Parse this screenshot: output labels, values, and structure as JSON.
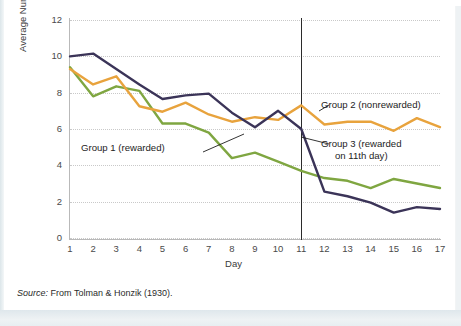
{
  "figure": {
    "source_prefix": "Source:",
    "source_text": "From Tolman & Honzik (1930)."
  },
  "annotations": {
    "group1": "Group 1 (rewarded)",
    "group2": "Group 2 (nonrewarded)",
    "group3_line1": "Group 3 (rewarded",
    "group3_line2": "on 11th day)"
  },
  "colors": {
    "group1_green": "#7FA641",
    "group2_orange": "#E8A33D",
    "group3_navy": "#3B3458",
    "axis": "#B9B9B9",
    "grid": "#C9C9C9",
    "marker_line": "#2B2B2B",
    "text": "#2B2B2B",
    "card_background": "#FFFFFF",
    "page_background": "#EEF2F4"
  },
  "chart_data": {
    "type": "line",
    "title": "",
    "xlabel": "Day",
    "ylabel": "Average Number of Errors",
    "x": [
      1,
      2,
      3,
      4,
      5,
      6,
      7,
      8,
      9,
      10,
      11,
      12,
      13,
      14,
      15,
      16,
      17
    ],
    "xtick_labels": [
      "1",
      "2",
      "3",
      "4",
      "5",
      "6",
      "7",
      "8",
      "9",
      "10",
      "11",
      "12",
      "13",
      "14",
      "15",
      "16",
      "17"
    ],
    "ytick_labels": [
      "0",
      "2",
      "4",
      "6",
      "8",
      "10",
      "12"
    ],
    "yticks": [
      0,
      2,
      4,
      6,
      8,
      10,
      12
    ],
    "xlim": [
      1,
      17
    ],
    "ylim": [
      0,
      12
    ],
    "grid": "horizontal-dotted",
    "legend": "inline-annotations",
    "annotation_line_day": 11,
    "series": [
      {
        "name": "Group 1 (rewarded)",
        "color": "#7FA641",
        "values": [
          9.4,
          7.8,
          8.35,
          8.1,
          6.3,
          6.3,
          5.8,
          4.4,
          4.7,
          4.2,
          3.7,
          3.3,
          3.15,
          2.75,
          3.25,
          3.0,
          2.75
        ]
      },
      {
        "name": "Group 2 (nonrewarded)",
        "color": "#E8A33D",
        "values": [
          9.3,
          8.45,
          8.9,
          7.25,
          6.95,
          7.45,
          6.8,
          6.4,
          6.65,
          6.5,
          7.3,
          6.25,
          6.4,
          6.4,
          5.9,
          6.6,
          6.1
        ]
      },
      {
        "name": "Group 3 (rewarded on 11th day)",
        "color": "#3B3458",
        "values": [
          10.0,
          10.15,
          9.3,
          8.45,
          7.65,
          7.85,
          7.95,
          6.9,
          6.1,
          7.0,
          6.0,
          2.55,
          2.3,
          1.95,
          1.4,
          1.7,
          1.6
        ]
      }
    ]
  }
}
